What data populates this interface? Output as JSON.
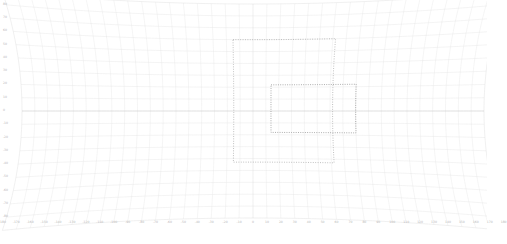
{
  "figure": {
    "kind": "graticule-map",
    "title": "",
    "background_color": "#ffffff"
  },
  "chart_data": {
    "type": "line",
    "title": "",
    "subtitle": "",
    "xlabel": "",
    "ylabel": "",
    "xlim": [
      -180,
      180
    ],
    "ylim": [
      -90,
      90
    ],
    "grid": true,
    "legend": null,
    "legend_position": "none",
    "projection": "curved-graticule",
    "tick_color": "#bdbdbd",
    "graticule_color": "#dcdcdc",
    "equator_color": "#c8c8c8",
    "boundary_color": "#a9a9a9",
    "x_ticks": [
      -180,
      -170,
      -160,
      -150,
      -140,
      -130,
      -120,
      -110,
      -100,
      -90,
      -80,
      -70,
      -60,
      -50,
      -40,
      -30,
      -20,
      -10,
      0,
      10,
      20,
      30,
      40,
      50,
      60,
      70,
      80,
      90,
      100,
      110,
      120,
      130,
      140,
      150,
      160,
      170,
      180
    ],
    "x_tick_labels": [
      "-180",
      "-170",
      "-160",
      "-150",
      "-140",
      "-130",
      "-120",
      "-110",
      "-100",
      "-90",
      "-80",
      "-70",
      "-60",
      "-50",
      "-40",
      "-30",
      "-20",
      "-10",
      "0",
      "10",
      "20",
      "30",
      "40",
      "50",
      "60",
      "70",
      "80",
      "90",
      "100",
      "110",
      "120",
      "130",
      "140",
      "150",
      "160",
      "170",
      "180"
    ],
    "y_ticks": [
      80,
      70,
      60,
      50,
      40,
      30,
      20,
      10,
      0,
      -10,
      -20,
      -30,
      -40,
      -50,
      -60,
      -70,
      -80
    ],
    "y_tick_labels": [
      "80",
      "70",
      "60",
      "50",
      "40",
      "30",
      "20",
      "10",
      "0",
      "-10",
      "-20",
      "-30",
      "-40",
      "-50",
      "-60",
      "-70",
      "-80"
    ],
    "meridian_step_deg": 10,
    "parallel_step_deg": 10,
    "series": [
      {
        "name": "outer-region-boundary",
        "style": "dotted",
        "color": "#9e9e9e",
        "bounds_deg": {
          "west": -15,
          "east": 62,
          "south": -43,
          "north": 60
        }
      },
      {
        "name": "inner-region-boundary",
        "style": "dotted",
        "color": "#8c8c8c",
        "bounds_deg": {
          "west": 14,
          "east": 80,
          "south": -18,
          "north": 22
        }
      }
    ],
    "annotations": []
  }
}
